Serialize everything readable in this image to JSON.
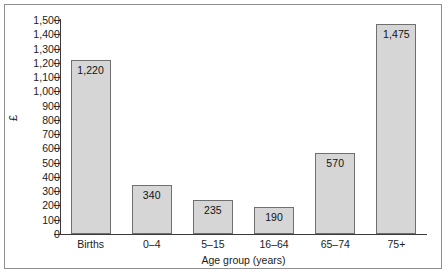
{
  "chart_data": {
    "type": "bar",
    "title": "",
    "subtitle": "",
    "xlabel": "Age group (years)",
    "ylabel": "£",
    "categories": [
      "Births",
      "0–4",
      "5–15",
      "16–64",
      "65–74",
      "75+"
    ],
    "values": [
      1220,
      340,
      235,
      190,
      570,
      1475
    ],
    "value_labels": [
      "1,220",
      "340",
      "235",
      "190",
      "570",
      "1,475"
    ],
    "ylim": [
      0,
      1500
    ],
    "ytick_step": 100,
    "ytick_labels": [
      "1,500",
      "1,400",
      "1,300",
      "1,200",
      "1,100",
      "1,000",
      "900",
      "800",
      "700",
      "600",
      "500",
      "400",
      "300",
      "200",
      "100",
      "0"
    ],
    "ytick_values": [
      1500,
      1400,
      1300,
      1200,
      1100,
      1000,
      900,
      800,
      700,
      600,
      500,
      400,
      300,
      200,
      100,
      0
    ],
    "grid": false,
    "legend": null,
    "legend_position": "none",
    "colors": {
      "bar_fill": "#d6d6d6",
      "bar_stroke": "#6f6f6f",
      "axis": "#3a3a3a",
      "text": "#1b1b1b",
      "frame": "#8e8e8e",
      "background": "#ffffff"
    }
  }
}
